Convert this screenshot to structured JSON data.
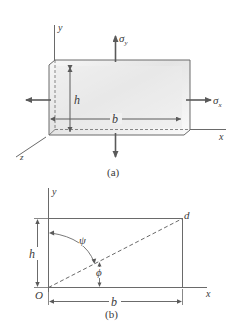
{
  "figure_a": {
    "caption": "(a)",
    "axis_y": "y",
    "axis_x": "x",
    "axis_z": "z",
    "stress_y": "σ",
    "stress_y_sub": "y",
    "stress_x": "σ",
    "stress_x_sub": "x",
    "height_label": "h",
    "width_label": "b"
  },
  "figure_b": {
    "caption": "(b)",
    "axis_y": "y",
    "axis_x": "x",
    "origin": "O",
    "corner": "d",
    "height_label": "h",
    "width_label": "b",
    "angle_psi": "ψ",
    "angle_phi": "ϕ"
  },
  "colors": {
    "line": "#6a6a6a",
    "text": "#3a3a3a",
    "fill_light": "#f4f4f4",
    "fill_shade": "#e2e2e2"
  }
}
